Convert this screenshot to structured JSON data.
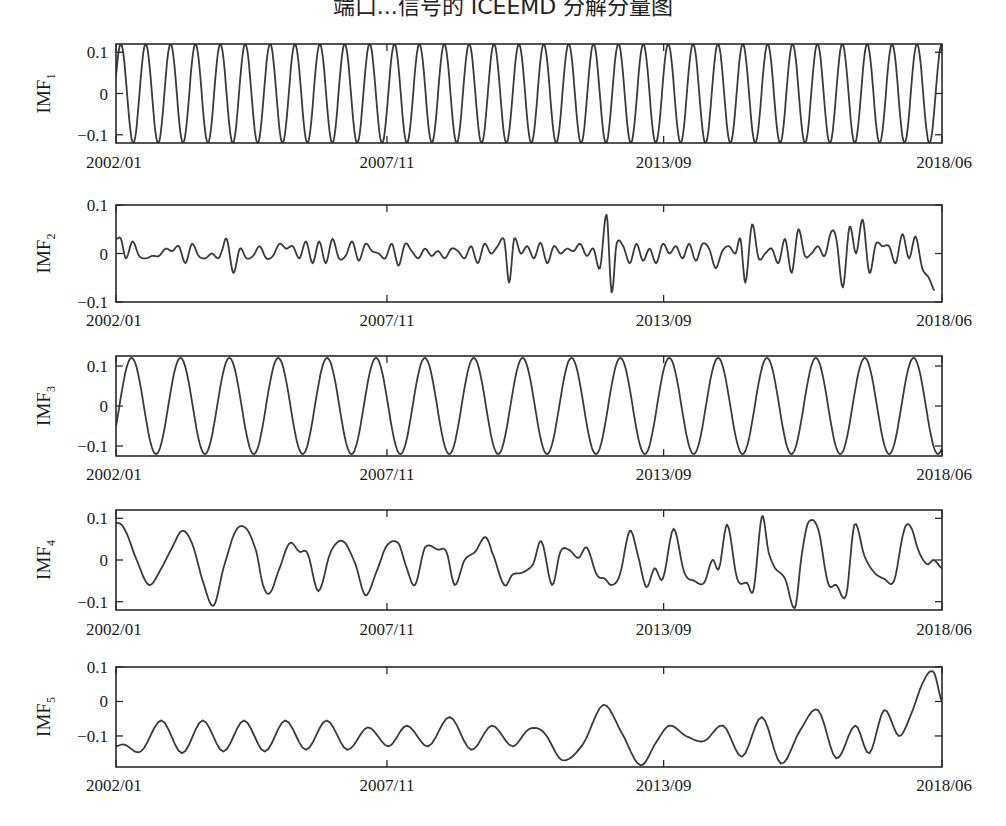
{
  "title": "端口...信号的 ICEEMD 分解分量图",
  "chart_data": {
    "type": "line",
    "layout": {
      "rows": 5,
      "cols": 1,
      "grid": false,
      "legend": "none"
    },
    "x_tick_labels": [
      "2002/01",
      "2007/11",
      "2013/09",
      "2018/06"
    ],
    "x_tick_fractions": [
      0.0,
      0.328,
      0.663,
      1.0
    ],
    "panels": [
      {
        "name": "IMF1",
        "ylabel": "IMF",
        "ylabel_sub": "1",
        "ylim": [
          -0.12,
          0.12
        ],
        "yticks": [
          0.1,
          0,
          -0.1
        ],
        "ytick_labels": [
          "0.1",
          "0",
          "−0.1"
        ],
        "description": "Near-constant-amplitude oscillation, ~33 cycles over 2002/01–2018/06, amplitude ≈0.12",
        "generator": {
          "kind": "sine",
          "cycles": 33.2,
          "amplitude": 0.12,
          "phase_deg": 20
        }
      },
      {
        "name": "IMF2",
        "ylabel": "IMF",
        "ylabel_sub": "2",
        "ylim": [
          -0.1,
          0.1
        ],
        "yticks": [
          0.1,
          0,
          -0.1
        ],
        "ytick_labels": [
          "0.1",
          "0",
          "−0.1"
        ],
        "description": "Irregular high-frequency component, small amplitude early, larger bursts near 2013 and 2015–2018",
        "x": [
          0,
          0.006,
          0.012,
          0.02,
          0.028,
          0.036,
          0.044,
          0.052,
          0.06,
          0.068,
          0.076,
          0.084,
          0.092,
          0.1,
          0.108,
          0.116,
          0.124,
          0.128,
          0.134,
          0.142,
          0.15,
          0.158,
          0.166,
          0.174,
          0.182,
          0.19,
          0.198,
          0.206,
          0.214,
          0.222,
          0.23,
          0.238,
          0.246,
          0.254,
          0.262,
          0.27,
          0.278,
          0.286,
          0.294,
          0.302,
          0.31,
          0.318,
          0.326,
          0.334,
          0.342,
          0.35,
          0.358,
          0.366,
          0.374,
          0.382,
          0.39,
          0.398,
          0.406,
          0.414,
          0.422,
          0.43,
          0.438,
          0.446,
          0.454,
          0.462,
          0.47,
          0.476,
          0.482,
          0.49,
          0.498,
          0.506,
          0.514,
          0.522,
          0.53,
          0.538,
          0.546,
          0.554,
          0.562,
          0.57,
          0.578,
          0.586,
          0.594,
          0.6,
          0.606,
          0.614,
          0.622,
          0.63,
          0.638,
          0.646,
          0.654,
          0.662,
          0.67,
          0.678,
          0.686,
          0.694,
          0.702,
          0.71,
          0.718,
          0.726,
          0.734,
          0.742,
          0.75,
          0.756,
          0.762,
          0.77,
          0.778,
          0.786,
          0.794,
          0.802,
          0.81,
          0.818,
          0.826,
          0.834,
          0.842,
          0.85,
          0.858,
          0.866,
          0.872,
          0.88,
          0.888,
          0.896,
          0.904,
          0.912,
          0.92,
          0.928,
          0.936,
          0.944,
          0.952,
          0.96,
          0.968,
          0.976,
          0.984,
          0.992,
          1.0
        ],
        "y": [
          0.03,
          0.03,
          -0.01,
          0.025,
          -0.005,
          -0.01,
          -0.005,
          -0.005,
          0.01,
          0.005,
          0.015,
          -0.02,
          0.02,
          -0.005,
          -0.01,
          0.0,
          -0.01,
          0.005,
          0.03,
          -0.04,
          0.01,
          -0.01,
          -0.005,
          0.015,
          -0.01,
          -0.005,
          0.02,
          0.01,
          0.015,
          -0.01,
          0.025,
          -0.02,
          0.025,
          -0.02,
          0.03,
          -0.01,
          -0.005,
          0.025,
          -0.015,
          0.02,
          0.005,
          0.0,
          -0.01,
          0.02,
          -0.025,
          0.02,
          0.005,
          -0.01,
          0.01,
          -0.005,
          0.005,
          -0.01,
          0.01,
          0.005,
          -0.01,
          0.015,
          -0.02,
          0.02,
          0.0,
          0.015,
          0.028,
          -0.06,
          0.03,
          0.0,
          0.015,
          -0.01,
          0.022,
          -0.02,
          0.015,
          0.0,
          0.01,
          0.005,
          0.02,
          -0.005,
          0.01,
          -0.03,
          0.08,
          -0.08,
          0.02,
          0.015,
          -0.02,
          0.02,
          -0.015,
          0.01,
          -0.02,
          0.02,
          0.0,
          0.015,
          -0.01,
          0.02,
          -0.015,
          0.02,
          0.01,
          -0.03,
          0.005,
          0.015,
          0.0,
          0.03,
          -0.06,
          0.06,
          -0.01,
          0.0,
          0.01,
          -0.02,
          0.03,
          -0.04,
          0.05,
          -0.005,
          0.0,
          0.015,
          -0.005,
          0.045,
          0.03,
          -0.07,
          0.055,
          0.0,
          0.07,
          -0.04,
          0.02,
          0.015,
          0.015,
          -0.02,
          0.04,
          -0.01,
          0.035,
          -0.03,
          -0.05,
          -0.08
        ]
      },
      {
        "name": "IMF3",
        "ylabel": "IMF",
        "ylabel_sub": "3",
        "ylim": [
          -0.125,
          0.125
        ],
        "yticks": [
          0.1,
          0,
          -0.1
        ],
        "ytick_labels": [
          "0.1",
          "0",
          "−0.1"
        ],
        "description": "Regular oscillation, ~17 cycles over the span, amplitude ≈0.12",
        "generator": {
          "kind": "sine",
          "cycles": 16.9,
          "amplitude": 0.12,
          "phase_deg": -25
        }
      },
      {
        "name": "IMF4",
        "ylabel": "IMF",
        "ylabel_sub": "4",
        "ylim": [
          -0.12,
          0.12
        ],
        "yticks": [
          0.1,
          0,
          -0.1
        ],
        "ytick_labels": [
          "0.1",
          "0",
          "−0.1"
        ],
        "description": "Medium-frequency quasi-periodic component with varying amplitude",
        "x": [
          0,
          0.01,
          0.025,
          0.04,
          0.055,
          0.068,
          0.08,
          0.092,
          0.105,
          0.118,
          0.13,
          0.145,
          0.158,
          0.17,
          0.178,
          0.186,
          0.196,
          0.21,
          0.222,
          0.232,
          0.245,
          0.26,
          0.275,
          0.29,
          0.302,
          0.315,
          0.328,
          0.342,
          0.352,
          0.362,
          0.374,
          0.39,
          0.4,
          0.41,
          0.422,
          0.435,
          0.447,
          0.455,
          0.47,
          0.48,
          0.492,
          0.505,
          0.515,
          0.528,
          0.538,
          0.548,
          0.56,
          0.57,
          0.582,
          0.592,
          0.6,
          0.61,
          0.622,
          0.632,
          0.642,
          0.652,
          0.662,
          0.675,
          0.688,
          0.7,
          0.712,
          0.722,
          0.73,
          0.74,
          0.752,
          0.764,
          0.772,
          0.782,
          0.79,
          0.798,
          0.81,
          0.822,
          0.83,
          0.838,
          0.85,
          0.862,
          0.872,
          0.884,
          0.894,
          0.906,
          0.918,
          0.93,
          0.942,
          0.954,
          0.962,
          0.972,
          0.982,
          0.99,
          1.0
        ],
        "y": [
          0.09,
          0.075,
          0.0,
          -0.06,
          -0.02,
          0.03,
          0.07,
          0.04,
          -0.05,
          -0.11,
          -0.02,
          0.07,
          0.075,
          0.02,
          -0.06,
          -0.08,
          -0.03,
          0.04,
          0.02,
          0.015,
          -0.075,
          0.02,
          0.045,
          -0.01,
          -0.085,
          -0.03,
          0.035,
          0.04,
          -0.02,
          -0.06,
          0.03,
          0.025,
          0.02,
          -0.06,
          0.0,
          0.02,
          0.055,
          0.02,
          -0.06,
          -0.035,
          -0.03,
          -0.01,
          0.045,
          -0.06,
          0.02,
          0.025,
          0.005,
          0.03,
          -0.035,
          -0.045,
          -0.06,
          -0.035,
          0.07,
          0.01,
          -0.065,
          -0.02,
          -0.045,
          0.075,
          -0.03,
          -0.05,
          -0.055,
          0.0,
          -0.02,
          0.085,
          -0.045,
          -0.055,
          -0.07,
          0.105,
          0.02,
          -0.02,
          -0.045,
          -0.115,
          0.01,
          0.09,
          0.075,
          -0.055,
          -0.06,
          -0.085,
          0.085,
          0.01,
          -0.03,
          -0.045,
          -0.05,
          0.07,
          0.08,
          0.02,
          -0.01,
          0.0,
          -0.02
        ]
      },
      {
        "name": "IMF5",
        "ylabel": "IMF",
        "ylabel_sub": "5",
        "ylim": [
          -0.19,
          0.1
        ],
        "yticks": [
          0.1,
          0,
          -0.1
        ],
        "ytick_labels": [
          "0.1",
          "0",
          "−0.1"
        ],
        "description": "Low-frequency oscillation around −0.1, amplitude growing toward the end, rising to ≈0.08 at 2018",
        "x": [
          0,
          0.01,
          0.03,
          0.055,
          0.08,
          0.105,
          0.13,
          0.155,
          0.18,
          0.205,
          0.23,
          0.255,
          0.28,
          0.305,
          0.33,
          0.352,
          0.378,
          0.404,
          0.43,
          0.455,
          0.48,
          0.5,
          0.518,
          0.54,
          0.565,
          0.59,
          0.612,
          0.635,
          0.655,
          0.67,
          0.69,
          0.712,
          0.735,
          0.758,
          0.782,
          0.805,
          0.828,
          0.85,
          0.872,
          0.895,
          0.912,
          0.93,
          0.948,
          0.962,
          0.978,
          0.99,
          1.0
        ],
        "y": [
          -0.13,
          -0.125,
          -0.145,
          -0.055,
          -0.15,
          -0.055,
          -0.145,
          -0.055,
          -0.145,
          -0.055,
          -0.14,
          -0.055,
          -0.14,
          -0.075,
          -0.13,
          -0.07,
          -0.13,
          -0.045,
          -0.14,
          -0.07,
          -0.13,
          -0.08,
          -0.09,
          -0.17,
          -0.125,
          -0.01,
          -0.09,
          -0.185,
          -0.115,
          -0.07,
          -0.1,
          -0.115,
          -0.07,
          -0.16,
          -0.045,
          -0.18,
          -0.085,
          -0.025,
          -0.165,
          -0.07,
          -0.15,
          -0.025,
          -0.1,
          -0.04,
          0.06,
          0.085,
          0.0
        ]
      }
    ]
  }
}
